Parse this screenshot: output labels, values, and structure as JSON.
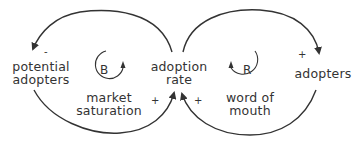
{
  "diagram": {
    "type": "causal-loop",
    "nodes": {
      "potential_adopters": {
        "line1": "potential",
        "line2": "adopters"
      },
      "adoption_rate": {
        "line1": "adoption",
        "line2": "rate"
      },
      "adopters": {
        "label": "adopters"
      }
    },
    "loops": {
      "balancing": {
        "letter": "B",
        "label_line1": "market",
        "label_line2": "saturation",
        "direction": "clockwise"
      },
      "reinforcing": {
        "letter": "R",
        "label_line1": "word of",
        "label_line2": "mouth",
        "direction": "counterclockwise"
      }
    },
    "links": [
      {
        "from": "adoption rate",
        "to": "potential adopters",
        "polarity": "-"
      },
      {
        "from": "potential adopters",
        "to": "adoption rate",
        "polarity": "+"
      },
      {
        "from": "adopters",
        "to": "adoption rate",
        "polarity": "+"
      },
      {
        "from": "adoption rate",
        "to": "adopters",
        "polarity": "+"
      }
    ],
    "signs": {
      "to_potential_adopters": "-",
      "to_adoption_rate_left": "+",
      "to_adoption_rate_right": "+",
      "to_adopters": "+"
    },
    "colors": {
      "stroke": "#333333",
      "text": "#333333",
      "background": "#ffffff"
    }
  }
}
